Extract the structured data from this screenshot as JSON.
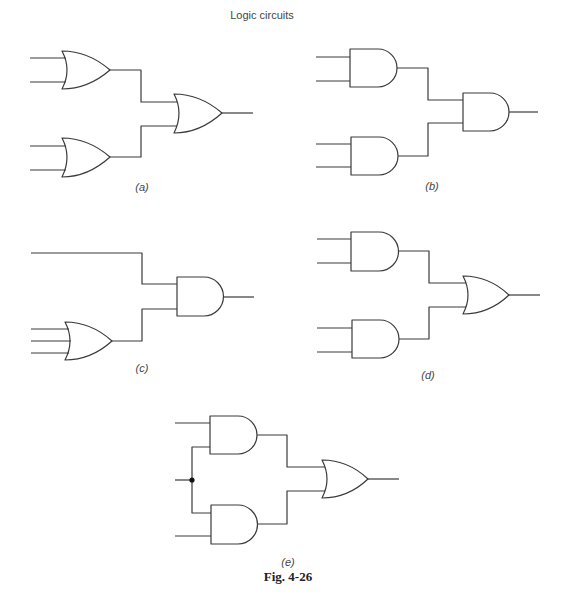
{
  "header": {
    "title": "Logic circuits"
  },
  "figure": {
    "caption": "Fig. 4-26"
  },
  "colors": {
    "line": "#3a3a3a",
    "text": "#444444",
    "junction": "#111111"
  },
  "circuits": [
    {
      "id": "a",
      "label": "(a)",
      "letter": "a",
      "gates": [
        "OR",
        "OR",
        "OR"
      ],
      "inputs": 4,
      "description": "Two 2-input OR gates feeding a 2-input OR gate"
    },
    {
      "id": "b",
      "label": "(b)",
      "letter": "b",
      "gates": [
        "AND",
        "AND",
        "AND"
      ],
      "inputs": 4,
      "description": "Two 2-input AND gates feeding a 2-input AND gate"
    },
    {
      "id": "c",
      "label": "(c)",
      "letter": "c",
      "gates": [
        "OR",
        "AND"
      ],
      "inputs": 4,
      "description": "Direct input and 3-input OR gate feeding a 2-input AND gate"
    },
    {
      "id": "d",
      "label": "(d)",
      "letter": "d",
      "gates": [
        "AND",
        "AND",
        "OR"
      ],
      "inputs": 4,
      "description": "Two 2-input AND gates feeding a 2-input OR gate"
    },
    {
      "id": "e",
      "label": "(e)",
      "letter": "e",
      "gates": [
        "AND",
        "AND",
        "OR"
      ],
      "inputs": 3,
      "description": "Shared middle input (junction) to two AND gates feeding a 2-input OR gate"
    }
  ]
}
